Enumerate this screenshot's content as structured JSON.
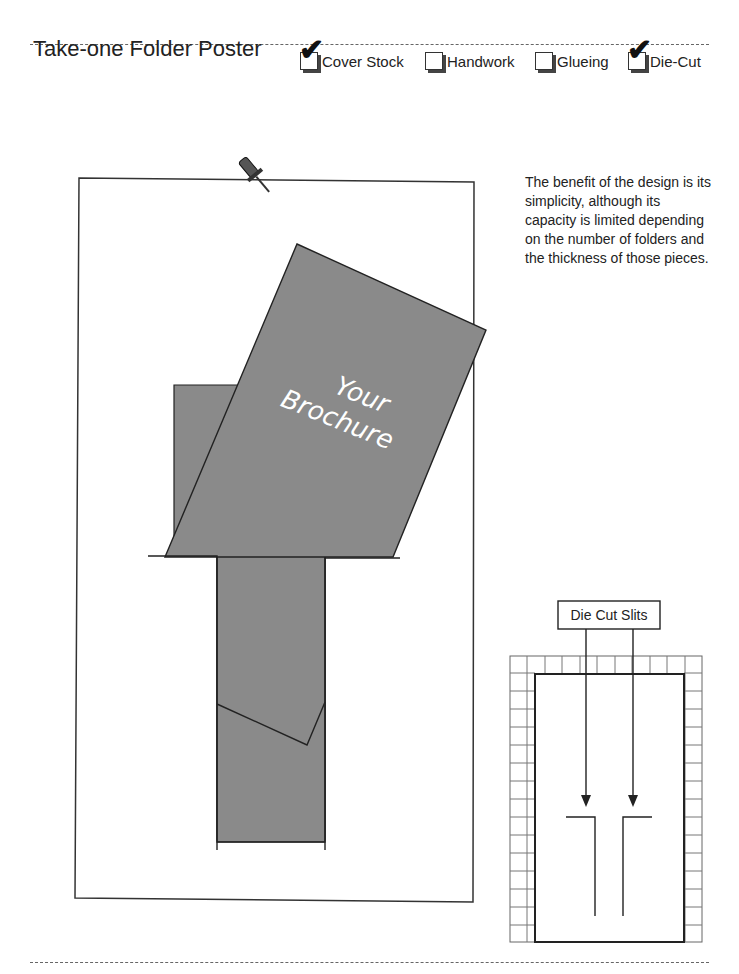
{
  "header": {
    "title": "Take-one Folder Poster",
    "options": [
      {
        "label": "Cover Stock",
        "checked": true
      },
      {
        "label": "Handwork",
        "checked": false
      },
      {
        "label": "Glueing",
        "checked": false
      },
      {
        "label": "Die-Cut",
        "checked": true
      }
    ]
  },
  "description": "The benefit of the design is its simplicity, although its capacity is limited depending on the number of folders and the thickness of those pieces.",
  "poster": {
    "brochure_line1": "Your",
    "brochure_line2": "Brochure",
    "pin_icon": "pushpin-icon"
  },
  "inset": {
    "label": "Die Cut Slits"
  },
  "colors": {
    "folder_fill": "#8a8a8a",
    "stroke": "#222222"
  }
}
